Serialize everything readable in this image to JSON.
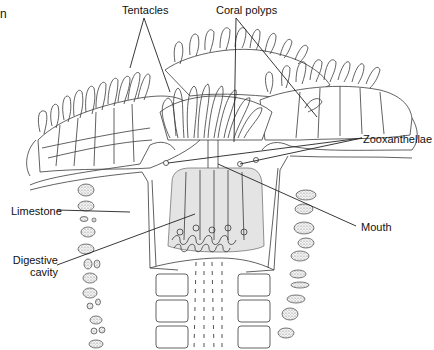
{
  "figure": {
    "partial_edge_text": "n"
  },
  "labels": {
    "tentacles": "Tentacles",
    "coral_polyps": "Coral polyps",
    "zooxanthellae": "Zooxanthellae",
    "limestone": "Limestone",
    "mouth": "Mouth",
    "digestive_cavity_line1": "Digestive",
    "digestive_cavity_line2": "cavity"
  },
  "colors": {
    "ink": "#3a3a3a",
    "background": "#ffffff",
    "shading": "#e4e4e4"
  }
}
